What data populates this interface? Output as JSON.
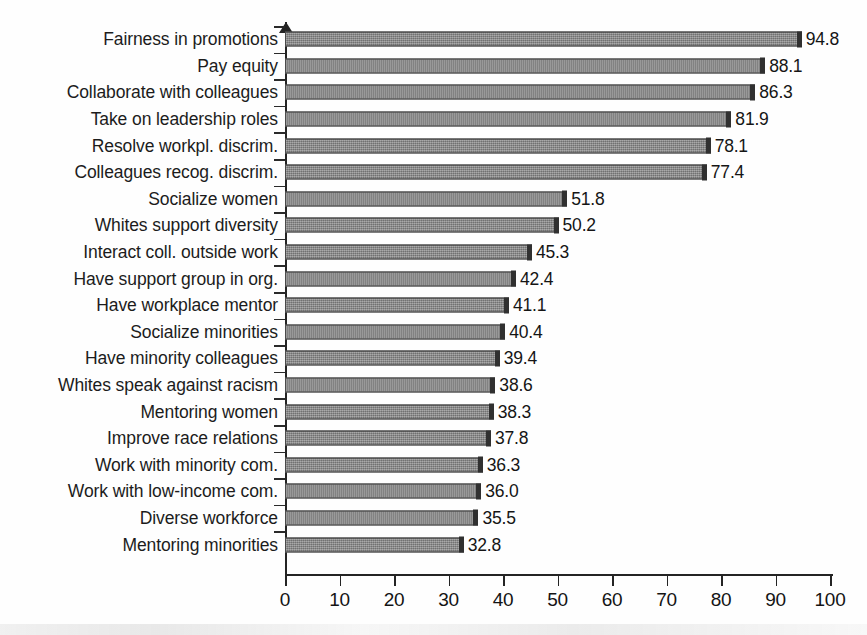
{
  "chart_data": {
    "type": "bar",
    "orientation": "horizontal",
    "title": "",
    "subtitle": "",
    "xlabel": "",
    "ylabel": "",
    "xlim": [
      0,
      100
    ],
    "xticks": [
      "0",
      "10",
      "20",
      "30",
      "40",
      "50",
      "60",
      "70",
      "80",
      "90",
      "100"
    ],
    "xtick_values": [
      0,
      10,
      20,
      30,
      40,
      50,
      60,
      70,
      80,
      90,
      100
    ],
    "grid": false,
    "legend": false,
    "legend_position": "none",
    "bar_color": "#8a8a8a",
    "bar_edge_color": "#303030",
    "axis_color": "#242424",
    "categories": [
      "Fairness in  promotions",
      "Pay equity",
      "Collaborate with colleagues",
      "Take on leadership roles",
      "Resolve workpl. discrim.",
      "Colleagues recog. discrim.",
      "Socialize women",
      "Whites support diversity",
      "Interact coll. outside work",
      "Have support group in org.",
      "Have workplace mentor",
      "Socialize minorities",
      "Have minority colleagues",
      "Whites speak against racism",
      "Mentoring women",
      "Improve race relations",
      "Work with minority com.",
      "Work with low-income com.",
      "Diverse workforce",
      "Mentoring minorities"
    ],
    "values": [
      94.8,
      88.1,
      86.3,
      81.9,
      78.1,
      77.4,
      51.8,
      50.2,
      45.3,
      42.4,
      41.1,
      40.4,
      39.4,
      38.6,
      38.3,
      37.8,
      36.3,
      36.0,
      35.5,
      32.8
    ],
    "value_labels": [
      "94.8",
      "88.1",
      "86.3",
      "81.9",
      "78.1",
      "77.4",
      "51.8",
      "50.2",
      "45.3",
      "42.4",
      "41.1",
      "40.4",
      "39.4",
      "38.6",
      "38.3",
      "37.8",
      "36.3",
      "36.0",
      "35.5",
      "32.8"
    ]
  }
}
